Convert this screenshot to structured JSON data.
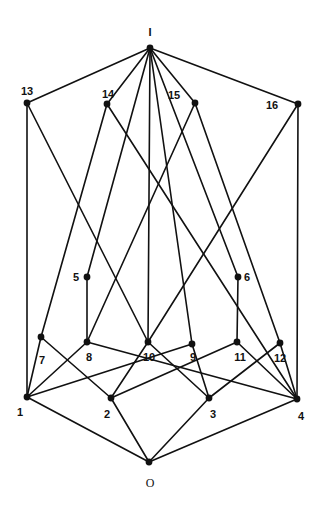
{
  "diagram": {
    "type": "Hasse diagram (lattice)",
    "nodes": [
      {
        "id": "I",
        "label": "I"
      },
      {
        "id": "13",
        "label": "13"
      },
      {
        "id": "14",
        "label": "14"
      },
      {
        "id": "15",
        "label": "15"
      },
      {
        "id": "16",
        "label": "16"
      },
      {
        "id": "5",
        "label": "5"
      },
      {
        "id": "6",
        "label": "6"
      },
      {
        "id": "7",
        "label": "7"
      },
      {
        "id": "8",
        "label": "8"
      },
      {
        "id": "10",
        "label": "10"
      },
      {
        "id": "9",
        "label": "9"
      },
      {
        "id": "11",
        "label": "11"
      },
      {
        "id": "12",
        "label": "12"
      },
      {
        "id": "1",
        "label": "1"
      },
      {
        "id": "2",
        "label": "2"
      },
      {
        "id": "3",
        "label": "3"
      },
      {
        "id": "4",
        "label": "4"
      },
      {
        "id": "O",
        "label": "O"
      }
    ],
    "edges": [
      [
        "I",
        "13"
      ],
      [
        "I",
        "14"
      ],
      [
        "I",
        "15"
      ],
      [
        "I",
        "16"
      ],
      [
        "I",
        "5"
      ],
      [
        "I",
        "10"
      ],
      [
        "I",
        "9"
      ],
      [
        "I",
        "6"
      ],
      [
        "13",
        "1"
      ],
      [
        "13",
        "10"
      ],
      [
        "14",
        "7"
      ],
      [
        "14",
        "4"
      ],
      [
        "15",
        "8"
      ],
      [
        "15",
        "12"
      ],
      [
        "16",
        "10"
      ],
      [
        "16",
        "4"
      ],
      [
        "5",
        "8"
      ],
      [
        "6",
        "11"
      ],
      [
        "7",
        "1"
      ],
      [
        "7",
        "2"
      ],
      [
        "8",
        "1"
      ],
      [
        "8",
        "4"
      ],
      [
        "9",
        "1"
      ],
      [
        "9",
        "3"
      ],
      [
        "10",
        "2"
      ],
      [
        "10",
        "3"
      ],
      [
        "11",
        "2"
      ],
      [
        "11",
        "4"
      ],
      [
        "12",
        "3"
      ],
      [
        "12",
        "4"
      ],
      [
        "1",
        "O"
      ],
      [
        "2",
        "O"
      ],
      [
        "3",
        "O"
      ],
      [
        "4",
        "O"
      ]
    ]
  }
}
